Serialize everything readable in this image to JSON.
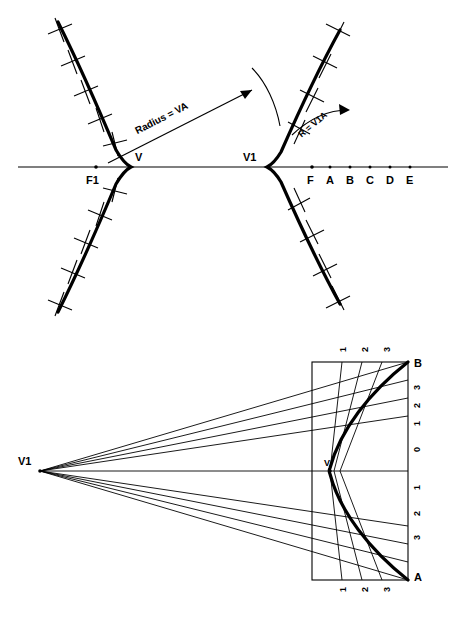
{
  "page": {
    "background": "#ffffff",
    "stroke_color": "#000000",
    "width": 466,
    "height": 622
  },
  "figures": [
    {
      "id": "hyperbola-construction",
      "name": "Hyperbola construction by radius arcs",
      "labels": {
        "focus_left": "F1",
        "vertex_left": "V",
        "vertex_right": "V1",
        "focus_right": "F",
        "radius_text": "Radius = VA",
        "r_text": "R = V1A",
        "axis_points": [
          "A",
          "B",
          "C",
          "D",
          "E"
        ]
      }
    },
    {
      "id": "parabola-ray-diagram",
      "name": "Parabola with converging rays to focus",
      "labels": {
        "apex": "V1",
        "vertex": "V",
        "corner_top": "B",
        "corner_bottom": "A",
        "top_ticks": [
          "1",
          "2",
          "3"
        ],
        "right_ticks": [
          "3",
          "2",
          "1",
          "0",
          "1",
          "2",
          "3"
        ],
        "bottom_ticks": [
          "1",
          "2",
          "3"
        ],
        "left_ticks": [
          "3",
          "2",
          "1"
        ]
      }
    }
  ]
}
